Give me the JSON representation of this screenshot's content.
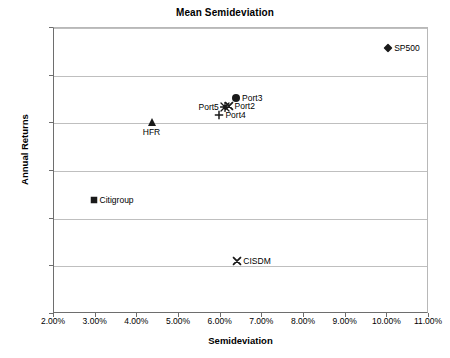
{
  "chart_data": {
    "type": "scatter",
    "title": "Mean Semideviation",
    "xlabel": "Semideviation",
    "ylabel": "Annual Returns",
    "xlim": [
      0.02,
      0.11
    ],
    "ylim": [
      0.06,
      0.12
    ],
    "grid": true,
    "legend": "none (points labeled directly)",
    "x_tick_labels": [
      "2.00%",
      "3.00%",
      "4.00%",
      "5.00%",
      "6.00%",
      "7.00%",
      "8.00%",
      "9.00%",
      "10.00%",
      "11.00%"
    ],
    "x_tick_values": [
      0.02,
      0.03,
      0.04,
      0.05,
      0.06,
      0.07,
      0.08,
      0.09,
      0.1,
      0.11
    ],
    "y_tick_labels": [
      "6%",
      "7%",
      "8%",
      "9%",
      "10%",
      "11%",
      "12%"
    ],
    "y_tick_values": [
      0.06,
      0.07,
      0.08,
      0.09,
      0.1,
      0.11,
      0.12
    ],
    "points": [
      {
        "name": "SP500",
        "label": "SP500",
        "x": 0.1002,
        "y": 0.1158,
        "marker": "diamond",
        "label_position": "right"
      },
      {
        "name": "Port3",
        "label": "Port3",
        "x": 0.0637,
        "y": 0.1053,
        "marker": "circle",
        "label_position": "right"
      },
      {
        "name": "Port2",
        "label": "Port2",
        "x": 0.0619,
        "y": 0.1036,
        "marker": "x",
        "label_position": "right"
      },
      {
        "name": "Port5",
        "label": "Port5",
        "x": 0.061,
        "y": 0.1034,
        "marker": "star",
        "label_position": "left"
      },
      {
        "name": "Port4",
        "label": "Port4",
        "x": 0.0597,
        "y": 0.1018,
        "marker": "plus",
        "label_position": "right"
      },
      {
        "name": "HFR",
        "label": "HFR",
        "x": 0.0434,
        "y": 0.1002,
        "marker": "triangle",
        "label_position": "below"
      },
      {
        "name": "Citigroup",
        "label": "Citigroup",
        "x": 0.0295,
        "y": 0.084,
        "marker": "square",
        "label_position": "right"
      },
      {
        "name": "CISDM",
        "label": "CISDM",
        "x": 0.064,
        "y": 0.0712,
        "marker": "x",
        "label_position": "right"
      }
    ]
  },
  "colors": {
    "marker": "#1a1a1a",
    "gridline": "#bfbfbf",
    "axis": "#6e6e6e",
    "text": "#000000",
    "background": "#ffffff"
  }
}
